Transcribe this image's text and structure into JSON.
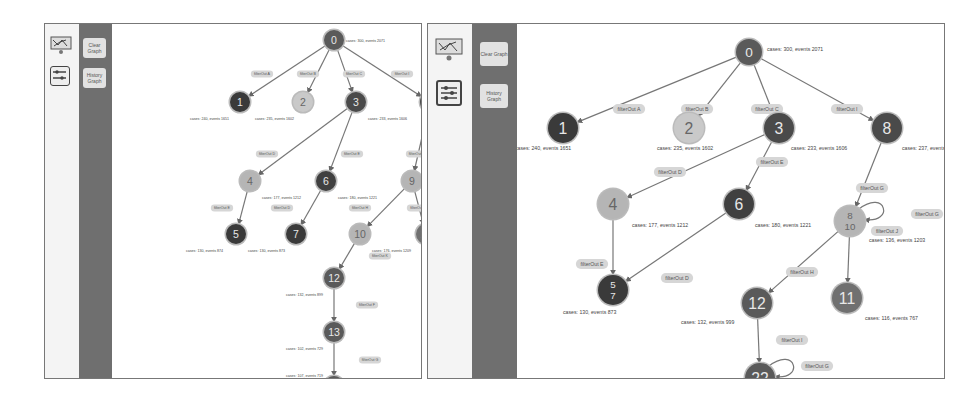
{
  "panels": [
    {
      "id": "left",
      "toolbar": {
        "icons": [
          "process-map-icon",
          "filter-sliders-icon"
        ]
      },
      "sidebar": {
        "buttons": [
          {
            "label": "Clear Graph"
          },
          {
            "label": "History Graph"
          }
        ]
      },
      "graph": {
        "nodes": [
          {
            "id": "0",
            "label": "0",
            "x": 222,
            "y": 16,
            "r": 10,
            "fill": "#5a5a5a",
            "info": "cases: 300, events 2071",
            "ix": 234,
            "iy": 18
          },
          {
            "id": "1",
            "label": "1",
            "x": 128,
            "y": 78,
            "r": 10,
            "fill": "#3a3a3a",
            "info": "cases: 240, events 1651",
            "ix": 78,
            "iy": 96
          },
          {
            "id": "2",
            "label": "2",
            "x": 191,
            "y": 78,
            "r": 10,
            "fill": "#c9c9c9",
            "info": "cases: 235, events 1602",
            "ix": 143,
            "iy": 96
          },
          {
            "id": "3",
            "label": "3",
            "x": 244,
            "y": 78,
            "r": 10,
            "fill": "#4a4a4a",
            "info": "cases: 233, events 1606",
            "ix": 256,
            "iy": 96
          },
          {
            "id": "8",
            "label": "8",
            "x": 318,
            "y": 78,
            "r": 10,
            "fill": "#4a4a4a",
            "info": "cases: 237, events 1617",
            "ix": 330,
            "iy": 96
          },
          {
            "id": "4",
            "label": "4",
            "x": 138,
            "y": 157,
            "r": 10,
            "fill": "#b5b5b5",
            "info": "cases: 177, events 1212",
            "ix": 150,
            "iy": 175
          },
          {
            "id": "6",
            "label": "6",
            "x": 214,
            "y": 157,
            "r": 10,
            "fill": "#404040",
            "info": "cases: 180, events 1221",
            "ix": 226,
            "iy": 175
          },
          {
            "id": "9",
            "label": "9",
            "x": 300,
            "y": 157,
            "r": 10,
            "fill": "#b5b5b5",
            "info": "cases: 176, events 1209",
            "ix": 312,
            "iy": 175
          },
          {
            "id": "5",
            "label": "5",
            "x": 124,
            "y": 210,
            "r": 10,
            "fill": "#3a3a3a",
            "info": "cases: 130, events 874",
            "ix": 74,
            "iy": 228
          },
          {
            "id": "7",
            "label": "7",
            "x": 184,
            "y": 210,
            "r": 10,
            "fill": "#3a3a3a",
            "info": "cases: 130, events 873",
            "ix": 136,
            "iy": 228
          },
          {
            "id": "10",
            "label": "10",
            "x": 248,
            "y": 210,
            "r": 10,
            "fill": "#b5b5b5",
            "info": "cases: 176, events 1209",
            "ix": 260,
            "iy": 228
          },
          {
            "id": "11",
            "label": "11",
            "x": 314,
            "y": 210,
            "r": 10,
            "fill": "#707070",
            "info": "cases: 116, events 767",
            "ix": 326,
            "iy": 228
          },
          {
            "id": "12",
            "label": "12",
            "x": 222,
            "y": 254,
            "r": 10,
            "fill": "#5a5a5a",
            "info": "cases: 132, events 899",
            "ix": 174,
            "iy": 272
          },
          {
            "id": "13",
            "label": "13",
            "x": 222,
            "y": 308,
            "r": 10,
            "fill": "#5a5a5a",
            "info": "cases: 102, events 729",
            "ix": 174,
            "iy": 326
          },
          {
            "id": "14",
            "label": "14",
            "x": 222,
            "y": 362,
            "r": 10,
            "fill": "#5a5a5a",
            "info": "cases: 107, events 719",
            "ix": 174,
            "iy": 353
          }
        ],
        "edges": [
          {
            "from": "0",
            "to": "1",
            "label": "filterOut A",
            "lx": 150,
            "ly": 50
          },
          {
            "from": "0",
            "to": "2",
            "label": "filterOut B",
            "lx": 196,
            "ly": 50
          },
          {
            "from": "0",
            "to": "3",
            "label": "filterOut C",
            "lx": 242,
            "ly": 50
          },
          {
            "from": "0",
            "to": "8",
            "label": "filterOut I",
            "lx": 290,
            "ly": 50
          },
          {
            "from": "3",
            "to": "4",
            "label": "filterOut D",
            "lx": 155,
            "ly": 130
          },
          {
            "from": "3",
            "to": "6",
            "label": "filterOut E",
            "lx": 240,
            "ly": 130
          },
          {
            "from": "8",
            "to": "9",
            "label": "filterOut G",
            "lx": 305,
            "ly": 130
          },
          {
            "from": "4",
            "to": "5",
            "label": "filterOut E",
            "lx": 110,
            "ly": 184
          },
          {
            "from": "6",
            "to": "7",
            "label": "filterOut D",
            "lx": 170,
            "ly": 184
          },
          {
            "from": "9",
            "to": "10",
            "label": "filterOut H",
            "lx": 248,
            "ly": 184
          },
          {
            "from": "9",
            "to": "11",
            "label": "filterOut J",
            "lx": 306,
            "ly": 184
          },
          {
            "from": "10",
            "to": "12",
            "label": "filterOut K",
            "lx": 268,
            "ly": 232
          },
          {
            "from": "12",
            "to": "13",
            "label": "filterOut F",
            "lx": 255,
            "ly": 281
          },
          {
            "from": "13",
            "to": "14",
            "label": "filterOut G",
            "lx": 258,
            "ly": 336
          }
        ]
      }
    },
    {
      "id": "right",
      "toolbar": {
        "icons": [
          "process-map-icon",
          "filter-sliders-icon"
        ]
      },
      "sidebar": {
        "buttons": [
          {
            "label": "Clear Graph"
          },
          {
            "label": "History Graph"
          }
        ]
      },
      "graph": {
        "nodes": [
          {
            "id": "0",
            "label": "0",
            "x": 232,
            "y": 28,
            "r": 13,
            "fill": "#5a5a5a",
            "info": "cases: 300, events 2071",
            "ix": 250,
            "iy": 27
          },
          {
            "id": "1",
            "label": "1",
            "x": 46,
            "y": 104,
            "r": 15,
            "fill": "#3a3a3a",
            "info": "cases: 240, events 1651",
            "ix": -2,
            "iy": 126
          },
          {
            "id": "2",
            "label": "2",
            "x": 172,
            "y": 104,
            "r": 15,
            "fill": "#c9c9c9",
            "info": "cases: 235, events 1602",
            "ix": 140,
            "iy": 126
          },
          {
            "id": "3",
            "label": "3",
            "x": 262,
            "y": 104,
            "r": 15,
            "fill": "#4a4a4a",
            "info": "cases: 233, events 1606",
            "ix": 274,
            "iy": 126
          },
          {
            "id": "8",
            "label": "8",
            "x": 370,
            "y": 104,
            "r": 15,
            "fill": "#4a4a4a",
            "info": "cases: 237, events 1617",
            "ix": 385,
            "iy": 126
          },
          {
            "id": "4",
            "label": "4",
            "x": 96,
            "y": 180,
            "r": 15,
            "fill": "#b5b5b5",
            "info": "cases: 177, events 1212",
            "ix": 115,
            "iy": 203
          },
          {
            "id": "6",
            "label": "6",
            "x": 222,
            "y": 180,
            "r": 15,
            "fill": "#404040",
            "info": "cases: 180, events 1221",
            "ix": 238,
            "iy": 203
          },
          {
            "id": "8_10",
            "label": "8\n10",
            "x": 333,
            "y": 197,
            "r": 15,
            "fill": "#b5b5b5",
            "info": "cases: 136, events 1203",
            "ix": 352,
            "iy": 218
          },
          {
            "id": "5_7",
            "label": "5\n7",
            "x": 96,
            "y": 266,
            "r": 15,
            "fill": "#3a3a3a",
            "info": "cases: 130, events 873",
            "ix": 46,
            "iy": 290
          },
          {
            "id": "12",
            "label": "12",
            "x": 240,
            "y": 279,
            "r": 15,
            "fill": "#5a5a5a",
            "info": "cases: 132, events 999",
            "ix": 164,
            "iy": 300
          },
          {
            "id": "11",
            "label": "11",
            "x": 330,
            "y": 274,
            "r": 15,
            "fill": "#707070",
            "info": "cases: 116, events 767",
            "ix": 348,
            "iy": 296
          },
          {
            "id": "22",
            "label": "22",
            "x": 243,
            "y": 354,
            "r": 15,
            "fill": "#5a5a5a",
            "info": "cases: 107, events 719",
            "ix": 165,
            "iy": 374
          }
        ],
        "edges": [
          {
            "from": "0",
            "to": "1",
            "label": "filterOut A",
            "lx": 112,
            "ly": 85
          },
          {
            "from": "0",
            "to": "2",
            "label": "filterOut B",
            "lx": 180,
            "ly": 85
          },
          {
            "from": "0",
            "to": "3",
            "label": "filterOut C",
            "lx": 250,
            "ly": 85
          },
          {
            "from": "0",
            "to": "8",
            "label": "filterOut I",
            "lx": 330,
            "ly": 85
          },
          {
            "from": "3",
            "to": "4",
            "label": "filterOut D",
            "lx": 153,
            "ly": 148
          },
          {
            "from": "3",
            "to": "6",
            "label": "filterOut E",
            "lx": 255,
            "ly": 138
          },
          {
            "from": "8",
            "to": "8_10",
            "label": "filterOut G",
            "lx": 355,
            "ly": 164
          },
          {
            "from": "4",
            "to": "5_7",
            "label": "filterOut E",
            "lx": 75,
            "ly": 240
          },
          {
            "from": "6",
            "to": "5_7",
            "label": "filterOut D",
            "lx": 160,
            "ly": 254
          },
          {
            "from": "8_10",
            "to": "12",
            "label": "filterOut H",
            "lx": 285,
            "ly": 248
          },
          {
            "from": "8_10",
            "to": "11",
            "label": "filterOut J",
            "lx": 370,
            "ly": 207
          },
          {
            "from": "12",
            "to": "22",
            "label": "filterOut I",
            "lx": 275,
            "ly": 316
          }
        ],
        "loops": [
          {
            "node": "8_10",
            "label": "filterOut G",
            "lx": 410,
            "ly": 190
          },
          {
            "node": "22",
            "label": "filterOut G",
            "lx": 300,
            "ly": 342
          }
        ]
      }
    }
  ]
}
